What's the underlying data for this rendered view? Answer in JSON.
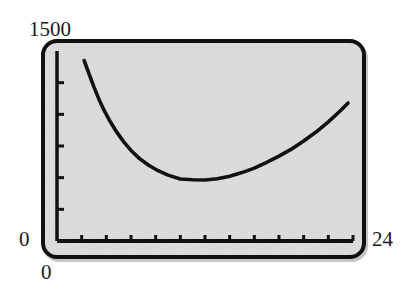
{
  "device": {
    "kind": "graphing-calculator-screen",
    "screen_bg": "#d6d6d6",
    "bezel_color": "#111111",
    "trace_color": "#111111"
  },
  "labels": {
    "y_max": "1500",
    "y_min": "0",
    "x_min": "0",
    "x_max": "24"
  },
  "chart_data": {
    "type": "line",
    "title": "",
    "xlabel": "",
    "ylabel": "",
    "xlim": [
      0,
      24
    ],
    "ylim": [
      0,
      1500
    ],
    "grid": false,
    "legend": null,
    "axes": {
      "x_axis_position": "bottom",
      "y_axis_position": "left",
      "x_tick_count": 12,
      "y_tick_count": 5,
      "x_tick_values": [
        2,
        4,
        6,
        8,
        10,
        12,
        14,
        16,
        18,
        20,
        22,
        24
      ],
      "y_tick_values": [
        250,
        500,
        750,
        1000,
        1250
      ],
      "tick_labels_shown": false
    },
    "series": [
      {
        "name": "curve",
        "x": [
          2.2,
          2.6,
          3.0,
          3.4,
          3.8,
          4.3,
          4.8,
          5.4,
          6.0,
          6.7,
          7.4,
          8.2,
          9.0,
          10.0,
          11.0,
          12.0,
          13.0,
          14.0,
          15.0,
          16.0,
          17.0,
          18.0,
          19.0,
          20.0,
          21.0,
          22.0,
          23.0,
          23.6
        ],
        "y": [
          1425,
          1320,
          1215,
          1120,
          1035,
          945,
          865,
          785,
          715,
          650,
          600,
          555,
          520,
          490,
          483,
          482,
          492,
          512,
          540,
          575,
          620,
          670,
          725,
          790,
          860,
          940,
          1030,
          1090
        ]
      }
    ]
  }
}
